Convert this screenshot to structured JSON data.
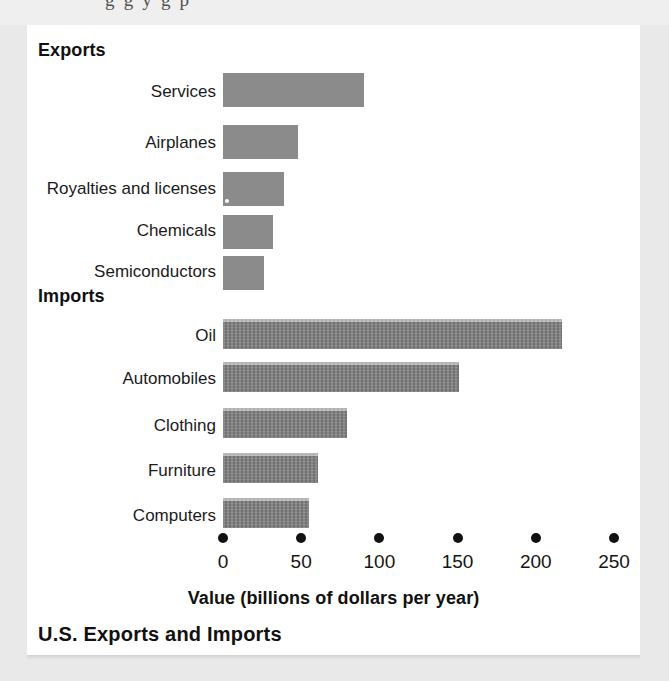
{
  "page": {
    "cutoff_text_above": "g g y g     p"
  },
  "chart_data": {
    "type": "bar",
    "orientation": "horizontal",
    "title": "U.S. Exports and Imports",
    "xlabel": "Value (billions of dollars per year)",
    "ylabel": "",
    "xlim": [
      0,
      250
    ],
    "xticks": [
      0,
      50,
      100,
      150,
      200,
      250
    ],
    "xtick_labels": [
      "0",
      "50",
      "100",
      "150",
      "200",
      "250"
    ],
    "grid": false,
    "legend": "none",
    "groups": [
      {
        "name": "Exports",
        "categories": [
          "Services",
          "Airplanes",
          "Royalties and licenses",
          "Chemicals",
          "Semiconductors"
        ],
        "values": [
          90,
          48,
          39,
          32,
          26
        ]
      },
      {
        "name": "Imports",
        "categories": [
          "Oil",
          "Automobiles",
          "Clothing",
          "Furniture",
          "Computers"
        ],
        "values": [
          217,
          151,
          79,
          61,
          55
        ]
      }
    ],
    "bar_color": "#8b8b8b",
    "import_bar_color": "#7e7e7e",
    "axis_color": "#111111"
  },
  "sections": {
    "exports_heading": "Exports",
    "imports_heading": "Imports"
  }
}
